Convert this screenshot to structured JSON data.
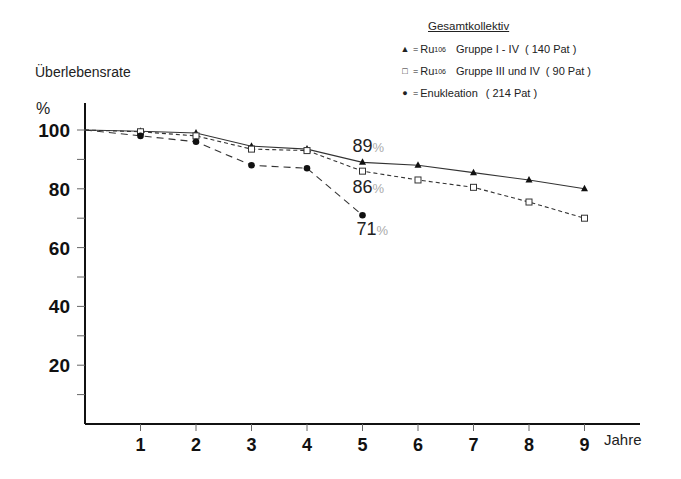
{
  "chart_data": {
    "type": "line",
    "title": "",
    "xlabel": "Jahre",
    "ylabel": "Überlebensrate",
    "yunit": "%",
    "x": [
      0,
      1,
      2,
      3,
      4,
      5,
      6,
      7,
      8,
      9
    ],
    "x_ticks": [
      "1",
      "2",
      "3",
      "4",
      "5",
      "6",
      "7",
      "8",
      "9"
    ],
    "y_ticks": [
      "20",
      "40",
      "60",
      "80",
      "100"
    ],
    "ylim": [
      0,
      100
    ],
    "xlim": [
      0,
      9.5
    ],
    "grid": false,
    "legend_position": "top-right",
    "legend_title": "Gesamtkollektiv",
    "series": [
      {
        "name": "Ru106 Gruppe I - IV (140 Pat)",
        "marker": "filled-triangle",
        "line": "solid",
        "x": [
          0,
          1,
          2,
          3,
          4,
          5,
          6,
          7,
          8,
          9
        ],
        "values": [
          100,
          99.6,
          99,
          94.5,
          93.5,
          89,
          88,
          85.5,
          83,
          80
        ]
      },
      {
        "name": "Ru106 Gruppe III und IV (90 Pat)",
        "marker": "open-square",
        "line": "short-dash",
        "x": [
          0,
          1,
          2,
          3,
          4,
          5,
          6,
          7,
          8,
          9
        ],
        "values": [
          100,
          99.4,
          98,
          93.5,
          93,
          86,
          83,
          80.5,
          75.5,
          70
        ]
      },
      {
        "name": "Enukleation (214 Pat)",
        "marker": "filled-circle",
        "line": "long-dash",
        "x": [
          0,
          1,
          2,
          3,
          4,
          5
        ],
        "values": [
          100,
          98,
          96,
          88,
          87,
          71
        ]
      }
    ],
    "annotations": [
      {
        "text": "89",
        "suffix": "%",
        "x": 5,
        "y": 89
      },
      {
        "text": "86",
        "suffix": "%",
        "x": 5,
        "y": 86
      },
      {
        "text": "71",
        "suffix": "%",
        "x": 5,
        "y": 71
      }
    ]
  },
  "legend": {
    "title": "Gesamtkollektiv",
    "items": [
      {
        "symbol": "▲",
        "prefix": "Ru",
        "sup": "106",
        "label": "Gruppe I - IV",
        "count": "( 140 Pat )"
      },
      {
        "symbol": "□",
        "prefix": "Ru",
        "sup": "106",
        "label": "Gruppe III und IV",
        "count": "( 90 Pat )"
      },
      {
        "symbol": "●",
        "prefix": "",
        "sup": "",
        "label": "Enukleation",
        "count": "( 214 Pat )"
      }
    ]
  },
  "axis": {
    "ylabel": "Überlebensrate",
    "yunit": "%",
    "xlabel": "Jahre"
  }
}
